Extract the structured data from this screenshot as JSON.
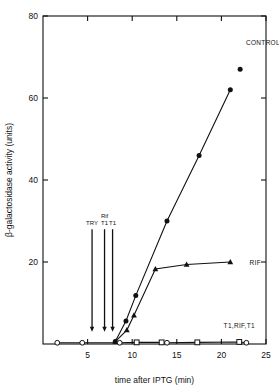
{
  "chart_data": {
    "type": "line",
    "title": "",
    "xlabel": "time after IPTG (min)",
    "ylabel": "β-galactosidase activity (units)",
    "xlim": [
      0,
      25
    ],
    "ylim": [
      0,
      80
    ],
    "xticks": [
      5,
      10,
      15,
      20,
      25
    ],
    "xtick_labels": [
      "5",
      "10",
      "15",
      "20",
      "25"
    ],
    "yticks": [
      20,
      40,
      60,
      80
    ],
    "ytick_labels": [
      "20",
      "40",
      "60",
      "80"
    ],
    "grid": false,
    "legend_position": "inline-right",
    "frame": "box",
    "series": [
      {
        "name": "CONTROL",
        "label": "CONTROL",
        "marker": "filled-circle",
        "label_x": 22.2,
        "label_y": 73.5,
        "points": [
          {
            "x": 8.1,
            "y": 0.6
          },
          {
            "x": 9.3,
            "y": 5.6
          },
          {
            "x": 10.4,
            "y": 11.8
          },
          {
            "x": 13.9,
            "y": 30.0
          },
          {
            "x": 17.5,
            "y": 46.0
          },
          {
            "x": 21.0,
            "y": 62.0
          }
        ],
        "extra_points": [
          {
            "x": 22.1,
            "y": 67.0
          }
        ]
      },
      {
        "name": "RIF",
        "label": "RIF",
        "marker": "filled-triangle",
        "label_x": 22.6,
        "label_y": 20.0,
        "points": [
          {
            "x": 8.1,
            "y": 0.6
          },
          {
            "x": 9.4,
            "y": 3.4
          },
          {
            "x": 10.2,
            "y": 7.0
          },
          {
            "x": 12.6,
            "y": 18.3
          },
          {
            "x": 16.1,
            "y": 19.4
          },
          {
            "x": 21.0,
            "y": 20.0
          }
        ]
      },
      {
        "name": "T1,RIF,T1",
        "label": "T1,RIF,T1",
        "marker": "open-circle-and-square",
        "label_x": 22.0,
        "label_y": 4.6,
        "points": [
          {
            "x": 1.6,
            "y": 0.3,
            "marker": "open-circle"
          },
          {
            "x": 4.4,
            "y": 0.3,
            "marker": "open-circle"
          },
          {
            "x": 8.6,
            "y": 0.3,
            "marker": "open-circle"
          },
          {
            "x": 10.5,
            "y": 0.4,
            "marker": "open-square"
          },
          {
            "x": 13.3,
            "y": 0.4,
            "marker": "open-square"
          },
          {
            "x": 13.9,
            "y": 0.3,
            "marker": "open-circle"
          },
          {
            "x": 17.3,
            "y": 0.4,
            "marker": "open-square"
          },
          {
            "x": 22.0,
            "y": 0.5,
            "marker": "open-square"
          },
          {
            "x": 22.8,
            "y": 0.3,
            "marker": "open-circle"
          }
        ]
      }
    ],
    "annotations": [
      {
        "label": "TRY",
        "x": 5.5,
        "label_line2": ""
      },
      {
        "label": "T1",
        "x": 6.9,
        "label_line2": "Rif"
      },
      {
        "label": "T1",
        "x": 7.8,
        "label_line2": ""
      }
    ],
    "annotation_arrow_top": 28.0,
    "annotation_arrow_bottom": 3.0,
    "colors": {
      "axis": "#111111",
      "line": "#111111",
      "marker_fill": "#111111",
      "marker_open_fill": "#ffffff",
      "background": "#ffffff"
    }
  }
}
